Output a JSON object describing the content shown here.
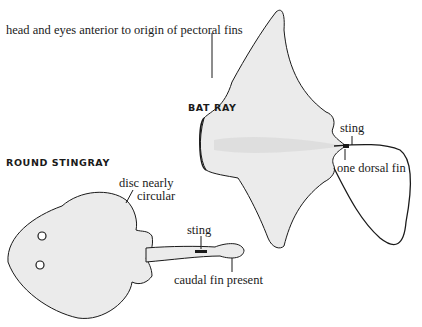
{
  "species": [
    {
      "name": "BAT RAY",
      "labels": {
        "head": "head and eyes anterior to origin of pectoral fins",
        "sting": "sting",
        "dorsal": "one dorsal fin"
      }
    },
    {
      "name": "ROUND STINGRAY",
      "labels": {
        "disc": "disc nearly",
        "disc2": "circular",
        "sting": "sting",
        "caudal": "caudal fin present"
      }
    }
  ],
  "colors": {
    "ink": "#1a1a1a",
    "fill": "#ebebeb",
    "background": "#ffffff"
  }
}
